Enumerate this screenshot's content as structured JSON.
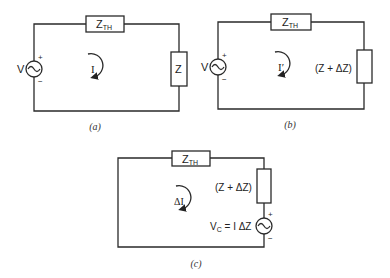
{
  "figures": [
    {
      "id": "a",
      "caption": "(a)",
      "source_label": "V",
      "source_plus": "+",
      "source_minus": "−",
      "zth_label": "Z",
      "zth_sub": "TH",
      "load_label": "Z",
      "current_label": "I"
    },
    {
      "id": "b",
      "caption": "(b)",
      "source_label": "V",
      "source_plus": "+",
      "source_minus": "−",
      "zth_label": "Z",
      "zth_sub": "TH",
      "load_label": "(Z + ΔZ)",
      "current_label": "I′"
    },
    {
      "id": "c",
      "caption": "(c)",
      "zth_label": "Z",
      "zth_sub": "TH",
      "load_label": "(Z + ΔZ)",
      "current_label": "ΔI",
      "source_label_main": "V",
      "source_label_sub": "C",
      "source_label_rest": " = I ΔZ",
      "source_plus": "+",
      "source_minus": "−"
    }
  ]
}
